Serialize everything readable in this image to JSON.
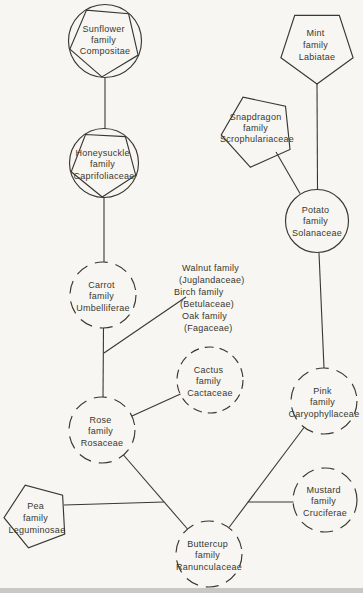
{
  "colors": {
    "background": "#f7f6f3",
    "ink": "#39382f"
  },
  "diagram_type": "plant-family-relationship-diagram",
  "nodes": {
    "sunflower": {
      "shape": "pentagon-in-circle",
      "lines": [
        "Sunflower",
        "family",
        "Compositae"
      ]
    },
    "mint": {
      "shape": "pentagon",
      "lines": [
        "Mint",
        "family",
        "Labiatae"
      ]
    },
    "snapdragon": {
      "shape": "pentagon",
      "lines": [
        "Snapdragon",
        "family",
        "Scrophulariaceae"
      ]
    },
    "honeysuckle": {
      "shape": "pentagon-in-circle",
      "lines": [
        "Honeysuckle",
        "family",
        "Caprifoliaceae"
      ]
    },
    "potato": {
      "shape": "circle",
      "lines": [
        "Potato",
        "family",
        "Solanaceae"
      ]
    },
    "carrot": {
      "shape": "dashed-circle",
      "lines": [
        "Carrot",
        "family",
        "Umbelliferae"
      ]
    },
    "cactus": {
      "shape": "dashed-circle",
      "lines": [
        "Cactus",
        "family",
        "Cactaceae"
      ]
    },
    "pink": {
      "shape": "dashed-circle",
      "lines": [
        "Pink",
        "family",
        "Caryophyllaceae"
      ]
    },
    "rose": {
      "shape": "dashed-circle",
      "lines": [
        "Rose",
        "family",
        "Rosaceae"
      ]
    },
    "pea": {
      "shape": "pentagon",
      "lines": [
        "Pea",
        "family",
        "Leguminosae"
      ]
    },
    "mustard": {
      "shape": "dashed-circle",
      "lines": [
        "Mustard",
        "family",
        "Cruciferae"
      ]
    },
    "buttercup": {
      "shape": "dashed-circle",
      "lines": [
        "Buttercup",
        "family",
        "Ranunculaceae"
      ]
    }
  },
  "annotation": {
    "lines": [
      "Walnut family",
      "(Juglandaceae)",
      "Birch family",
      "(Betulaceae)",
      "Oak family",
      "(Fagaceae)"
    ]
  },
  "edges": [
    [
      "sunflower",
      "honeysuckle"
    ],
    [
      "honeysuckle",
      "carrot"
    ],
    [
      "carrot",
      "rose"
    ],
    [
      "walnut-birch-oak-annotation",
      "carrot-rose-link"
    ],
    [
      "rose",
      "cactus"
    ],
    [
      "rose",
      "buttercup"
    ],
    [
      "pea",
      "rose-buttercup-link"
    ],
    [
      "mint",
      "potato"
    ],
    [
      "snapdragon",
      "potato"
    ],
    [
      "potato",
      "pink"
    ],
    [
      "pink",
      "buttercup"
    ],
    [
      "mustard",
      "pink-buttercup-link"
    ]
  ]
}
